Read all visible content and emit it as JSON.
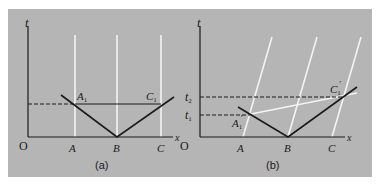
{
  "figure": {
    "background_color": "#b5b5b5",
    "axis_color": "#1a1a1a",
    "worldline_color": "#f4f4f4",
    "panels": [
      {
        "id": "a",
        "caption": "(a)",
        "axis_labels": {
          "t": "t",
          "x": "x",
          "origin": "O"
        },
        "points": {
          "A": "A",
          "B": "B",
          "C": "C"
        },
        "events": {
          "A1": "A",
          "A1_sub": "1",
          "C1": "C",
          "C1_sub": "1"
        }
      },
      {
        "id": "b",
        "caption": "(b)",
        "axis_labels": {
          "t": "t",
          "x": "x",
          "origin": "O"
        },
        "points": {
          "A": "A",
          "B": "B",
          "C": "C"
        },
        "time_marks": {
          "t1": "t",
          "t1_sub": "1",
          "t2": "t",
          "t2_sub": "2"
        },
        "events": {
          "A1p": "A",
          "A1p_sub": "1",
          "A1p_prime": "′",
          "C1p": "C",
          "C1p_sub": "1",
          "C1p_prime": "′"
        }
      }
    ]
  }
}
